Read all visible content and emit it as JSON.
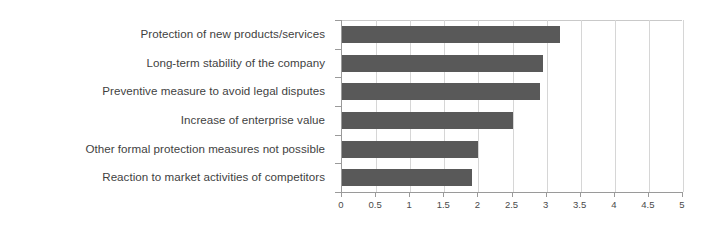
{
  "chart_data": {
    "type": "bar",
    "orientation": "horizontal",
    "title": "",
    "xlabel": "",
    "ylabel": "",
    "xlim": [
      0,
      5
    ],
    "ylim": null,
    "grid": true,
    "legend": false,
    "legend_position": "none",
    "bar_color": "#595959",
    "gridline_color": "#d6d6d6",
    "axis_color": "#9a9a9a",
    "label_color": "#3f3f3f",
    "categories": [
      "Protection of new products/services",
      "Long-term stability of the company",
      "Preventive measure to avoid legal disputes",
      "Increase of enterprise value",
      "Other formal protection measures not possible",
      "Reaction to market activities of competitors"
    ],
    "values": [
      3.2,
      2.95,
      2.9,
      2.5,
      2.0,
      1.9
    ],
    "xticks": [
      0,
      0.5,
      1,
      1.5,
      2,
      2.5,
      3,
      3.5,
      4,
      4.5,
      5
    ],
    "xtick_labels": [
      "0",
      "0.5",
      "1",
      "1.5",
      "2",
      "2.5",
      "3",
      "3.5",
      "4",
      "4.5",
      "5"
    ]
  }
}
